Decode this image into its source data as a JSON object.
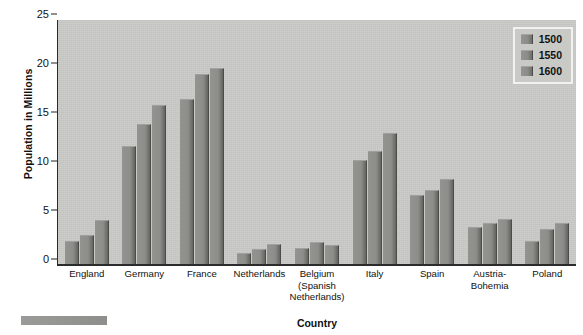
{
  "chart_data": {
    "type": "bar",
    "title": "",
    "xlabel": "Country",
    "ylabel": "Population in Millions",
    "ylim": [
      0,
      25
    ],
    "ytick_step": 5,
    "yticks": [
      0,
      5,
      10,
      15,
      20,
      25
    ],
    "grid": false,
    "legend_position": "top-right",
    "categories": [
      "England",
      "Germany",
      "France",
      "Netherlands",
      "Belgium\n(Spanish\nNetherlands)",
      "Italy",
      "Spain",
      "Austria-\nBohemia",
      "Poland"
    ],
    "series": [
      {
        "name": "1500",
        "values": [
          2.3,
          12.0,
          16.8,
          1.0,
          1.5,
          10.6,
          7.0,
          3.7,
          2.3
        ]
      },
      {
        "name": "1550",
        "values": [
          2.9,
          14.2,
          19.4,
          1.4,
          2.2,
          11.5,
          7.5,
          4.1,
          3.5
        ]
      },
      {
        "name": "1600",
        "values": [
          4.4,
          16.2,
          20.0,
          1.9,
          1.8,
          13.3,
          8.6,
          4.5,
          4.1
        ]
      }
    ],
    "colors": {
      "plot_background": "#c9c9c6",
      "bar_fill": "#8d8d89",
      "bar_shadow": "#4c4c49",
      "axis": "#2b2b2b",
      "text": "#111111",
      "legend_border": "#f2f2f0",
      "page_background": "#ffffff"
    }
  },
  "legend": {
    "items": [
      {
        "label": "1500"
      },
      {
        "label": "1550"
      },
      {
        "label": "1600"
      }
    ]
  },
  "axes": {
    "y_title": "Population in Millions",
    "x_title": "Country",
    "y_tick_labels": [
      "25",
      "20",
      "15",
      "10",
      "5",
      "0"
    ]
  }
}
